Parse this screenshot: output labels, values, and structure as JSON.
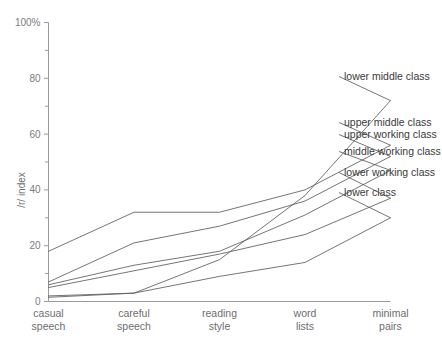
{
  "chart_data": {
    "type": "line",
    "title": "",
    "subtitle": "",
    "xlabel": "",
    "ylabel": "/r/ index",
    "ylim": [
      0,
      100
    ],
    "yticks": [
      0,
      20,
      40,
      60,
      80,
      100
    ],
    "ytick_labels": [
      "0",
      "20",
      "40",
      "60",
      "80",
      "100%"
    ],
    "yminor_ticks": [
      10,
      30,
      50,
      70,
      90
    ],
    "grid": false,
    "legend_position": "right-inline-labels",
    "categories": [
      "casual speech",
      "careful speech",
      "reading style",
      "word lists",
      "minimal pairs"
    ],
    "category_lines": [
      [
        "casual",
        "speech"
      ],
      [
        "careful",
        "speech"
      ],
      [
        "reading",
        "style"
      ],
      [
        "word",
        "lists"
      ],
      [
        "minimal",
        "pairs"
      ]
    ],
    "series": [
      {
        "name": "lower middle class",
        "values": [
          1.5,
          3,
          15,
          38,
          72
        ]
      },
      {
        "name": "upper middle class",
        "values": [
          18,
          32,
          32,
          40,
          56
        ]
      },
      {
        "name": "upper working class",
        "values": [
          7,
          21,
          27,
          36,
          52
        ]
      },
      {
        "name": "middle working class",
        "values": [
          6,
          13,
          18,
          31,
          47
        ]
      },
      {
        "name": "lower working class",
        "values": [
          5,
          11,
          17,
          24,
          37
        ]
      },
      {
        "name": "lower class",
        "values": [
          2,
          3,
          9,
          14,
          30
        ]
      }
    ],
    "annotations": [
      {
        "text": "lower middle class",
        "x": 344,
        "y": 80
      },
      {
        "text": "upper middle class",
        "x": 344,
        "y": 126
      },
      {
        "text": "upper working class",
        "x": 344,
        "y": 138
      },
      {
        "text": "middle working class",
        "x": 344,
        "y": 155
      },
      {
        "text": "lower working class",
        "x": 344,
        "y": 176
      },
      {
        "text": "lower class",
        "x": 344,
        "y": 196
      }
    ],
    "colors": {
      "line": "#5c5c5e",
      "axis": "#9a9a9c",
      "tick_text": "#7b7b7d",
      "label_text": "#3a3a3c",
      "background": "#ffffff"
    }
  }
}
